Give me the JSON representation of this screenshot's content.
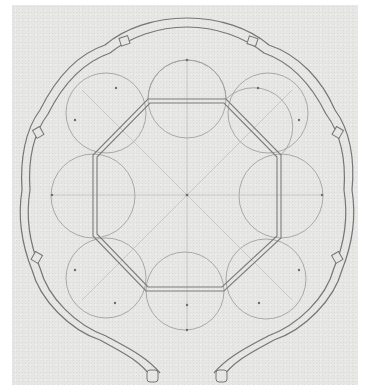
{
  "figure": {
    "type": "architectural-plan",
    "colors": {
      "paper": "#e6e6e4",
      "border": "#ffffff",
      "wall_line": "#7a7a7a",
      "construction_line": "#9a9a9a",
      "dot": "#6a6a6a"
    },
    "octagon": {
      "vertices": [
        [
          148,
          99
        ],
        [
          226,
          99
        ],
        [
          281,
          155
        ],
        [
          281,
          238
        ],
        [
          224,
          291
        ],
        [
          146,
          291
        ],
        [
          93,
          236
        ],
        [
          93,
          155
        ]
      ],
      "center": [
        187,
        195
      ]
    },
    "apse_count": 8,
    "outer_wall_lobes": 8,
    "entrance": "bottom"
  }
}
